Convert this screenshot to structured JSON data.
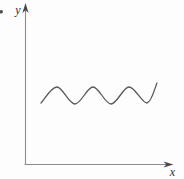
{
  "figure": {
    "y_axis_label": "y",
    "x_axis_label": "x",
    "colors": {
      "background": "#fdfdfd",
      "axis": "#8c8c8c",
      "arrow": "#4a4a4a",
      "curve": "#585858",
      "label": "#2f2f2f"
    },
    "wave": {
      "shape": "sine",
      "cycles": 3.25,
      "nodes": [
        [
          41,
          103
        ],
        [
          57,
          87
        ],
        [
          75,
          104
        ],
        [
          93,
          87
        ],
        [
          111,
          104
        ],
        [
          129,
          87
        ],
        [
          147,
          103
        ],
        [
          157,
          83
        ]
      ]
    }
  },
  "chart_data": {
    "type": "line",
    "title": "",
    "xlabel": "x",
    "ylabel": "y",
    "series": [
      {
        "name": "sine-wave",
        "description": "constant-amplitude sinusoid, approx 3.25 cycles, drawn in the upper-middle of the first quadrant; no tick marks or numeric axis values shown"
      }
    ],
    "axes": {
      "ticks": "none",
      "numeric_labels": "none"
    }
  }
}
